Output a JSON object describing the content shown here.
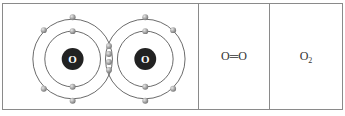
{
  "diagram": {
    "atoms": [
      {
        "symbol": "O",
        "cx": 70,
        "cy": 57
      },
      {
        "symbol": "O",
        "cx": 143,
        "cy": 57
      }
    ],
    "shared_electrons_count": 4,
    "colors": {
      "nucleus": "#222222",
      "electron": "#9a9a9a",
      "orbit": "#444444"
    }
  },
  "structural_formula": {
    "left": "O",
    "bond": "═",
    "right": "O"
  },
  "molecular_formula": {
    "element": "O",
    "subscript": "2"
  }
}
